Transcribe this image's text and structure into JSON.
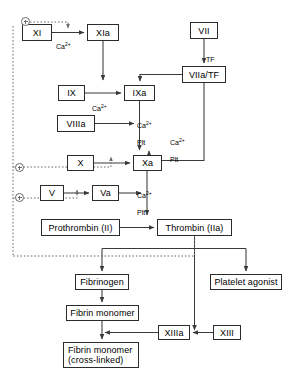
{
  "diagram": {
    "colors": {
      "box_border": "#2b2b2b",
      "solid_edge": "#3a3a3a",
      "dotted_edge": "#6b6b6b",
      "text": "#000000",
      "background": "#ffffff"
    },
    "nodes": [
      {
        "id": "XI",
        "label": "XI",
        "x": 22,
        "y": 24,
        "w": 30,
        "h": 17
      },
      {
        "id": "XIa",
        "label": "XIa",
        "x": 87,
        "y": 24,
        "w": 32,
        "h": 17
      },
      {
        "id": "VII",
        "label": "VII",
        "x": 190,
        "y": 22,
        "w": 28,
        "h": 17
      },
      {
        "id": "VIIaTF",
        "label": "VIIa/TF",
        "x": 182,
        "y": 66,
        "w": 44,
        "h": 17
      },
      {
        "id": "IX",
        "label": "IX",
        "x": 58,
        "y": 85,
        "w": 27,
        "h": 16
      },
      {
        "id": "IXa",
        "label": "IXa",
        "x": 124,
        "y": 85,
        "w": 31,
        "h": 16
      },
      {
        "id": "VIIIa",
        "label": "VIIIa",
        "x": 57,
        "y": 115,
        "w": 38,
        "h": 17
      },
      {
        "id": "X",
        "label": "X",
        "x": 67,
        "y": 155,
        "w": 27,
        "h": 16
      },
      {
        "id": "Xa",
        "label": "Xa",
        "x": 133,
        "y": 155,
        "w": 29,
        "h": 16
      },
      {
        "id": "V",
        "label": "V",
        "x": 40,
        "y": 185,
        "w": 24,
        "h": 16
      },
      {
        "id": "Va",
        "label": "Va",
        "x": 92,
        "y": 185,
        "w": 27,
        "h": 16
      },
      {
        "id": "Prothrombin",
        "label": "Prothrombin (II)",
        "x": 41,
        "y": 219,
        "w": 79,
        "h": 17
      },
      {
        "id": "Thrombin",
        "label": "Thrombin (IIa)",
        "x": 157,
        "y": 219,
        "w": 75,
        "h": 17
      },
      {
        "id": "Fibrinogen",
        "label": "Fibrinogen",
        "x": 75,
        "y": 274,
        "w": 54,
        "h": 16
      },
      {
        "id": "PlateletAgonist",
        "label": "Platelet agonist",
        "x": 210,
        "y": 274,
        "w": 72,
        "h": 16
      },
      {
        "id": "FibrinMonomer",
        "label": "Fibrin monomer",
        "x": 66,
        "y": 305,
        "w": 73,
        "h": 16
      },
      {
        "id": "XIIIa",
        "label": "XIIIa",
        "x": 158,
        "y": 325,
        "w": 32,
        "h": 15
      },
      {
        "id": "XIII",
        "label": "XIII",
        "x": 213,
        "y": 325,
        "w": 28,
        "h": 15
      },
      {
        "id": "FibrinCross",
        "label": "Fibrin monomer\n(cross-linked)",
        "x": 63,
        "y": 342,
        "w": 76,
        "h": 26
      }
    ],
    "edge_labels": [
      {
        "id": "ca-xi-xia",
        "text": "Ca",
        "sup": "2+",
        "x": 56,
        "y": 35
      },
      {
        "id": "tf",
        "text": "TF",
        "sup": "",
        "x": 206,
        "y": 48
      },
      {
        "id": "ca-ix-ixa",
        "text": "Ca",
        "sup": "2+",
        "x": 92,
        "y": 97
      },
      {
        "id": "ca-plt-ixa",
        "text": "Ca",
        "sup": "2+",
        "x": 137,
        "y": 116,
        "second": "Plt"
      },
      {
        "id": "ca-plt-tf",
        "text": "Ca",
        "sup": "2+",
        "x": 170,
        "y": 133,
        "second": "Plt"
      },
      {
        "id": "ca-plt-xa",
        "text": "Ca",
        "sup": "2+",
        "x": 137,
        "y": 186,
        "second": "Plt"
      }
    ],
    "feedback_markers": [
      {
        "id": "plus-xi",
        "x": 21,
        "y": 22
      },
      {
        "id": "plus-x",
        "x": 15,
        "y": 163
      },
      {
        "id": "plus-v",
        "x": 15,
        "y": 190
      }
    ]
  }
}
